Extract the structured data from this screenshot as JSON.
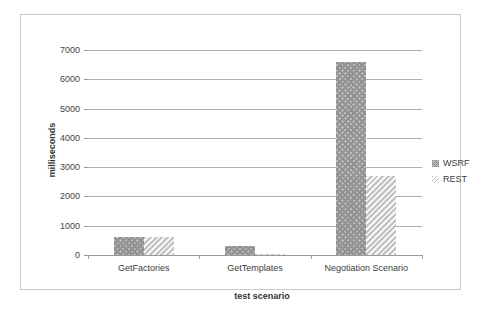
{
  "chart_data": {
    "type": "bar",
    "title": "",
    "xlabel": "test scenario",
    "ylabel": "milliseconds",
    "categories": [
      "GetFactories",
      "GetTemplates",
      "Negotiation Scenario"
    ],
    "series": [
      {
        "name": "WSRF",
        "values": [
          620,
          310,
          6580
        ]
      },
      {
        "name": "REST",
        "values": [
          600,
          30,
          2700
        ]
      }
    ],
    "ylim": [
      0,
      7000
    ],
    "ytick_labels": [
      "0",
      "1000",
      "2000",
      "3000",
      "4000",
      "5000",
      "6000",
      "7000"
    ],
    "ytick_values": [
      0,
      1000,
      2000,
      3000,
      4000,
      5000,
      6000,
      7000
    ],
    "grid": true,
    "legend_position": "right",
    "legend_entries": [
      "WSRF",
      "REST"
    ],
    "colors": {
      "wsrf_fill": "#b9b9b9",
      "wsrf_hatch": "#939393",
      "rest_fill": "#efefef",
      "rest_hatch": "#c2c2c2",
      "gridline": "#b0b0b0",
      "frame": "#c8c8c8",
      "text": "#3b3b3b"
    }
  }
}
